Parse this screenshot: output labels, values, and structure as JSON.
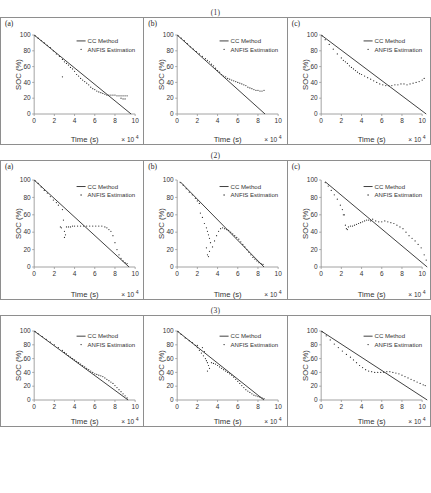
{
  "figure": {
    "rows": [
      {
        "label": "(1)"
      },
      {
        "label": "(2)"
      },
      {
        "label": "(3)"
      }
    ],
    "panel_labels": [
      "(a)",
      "(b)",
      "(c)"
    ],
    "legend": {
      "cc_method": "CC Method",
      "anfis": "ANFIS Estimation"
    },
    "axes": {
      "xlabel": "Time (s)",
      "ylabel": "SOC (%)",
      "x_multiplier": "× 10",
      "x_exponent": "4",
      "yticks": [
        "0",
        "20",
        "40",
        "60",
        "80",
        "100"
      ],
      "xticks": [
        "0",
        "2",
        "4",
        "6",
        "8",
        "10"
      ]
    },
    "colors": {
      "line": "#2b2b2b",
      "marker": "#2b2b2b",
      "axis": "#8c8c8c",
      "border": "#8e8e8e",
      "text": "#333333"
    }
  },
  "chart_data": [
    {
      "id": "r1c1",
      "type": "scatter",
      "title": "(1)(a)",
      "xlabel": "Time (s)",
      "ylabel": "SOC (%)",
      "xlim": [
        0,
        10
      ],
      "ylim": [
        0,
        100
      ],
      "grid": false,
      "legend_position": "top-right",
      "series": [
        {
          "name": "CC Method",
          "style": "line",
          "x": [
            0,
            9.6
          ],
          "y": [
            100,
            0
          ]
        },
        {
          "name": "ANFIS Estimation",
          "style": "markers",
          "x": [
            0.1,
            0.4,
            0.7,
            1.0,
            1.3,
            1.6,
            1.9,
            2.2,
            2.5,
            2.8,
            2.8,
            3.0,
            3.2,
            3.4,
            3.6,
            3.8,
            4.0,
            4.2,
            4.4,
            4.6,
            4.8,
            5.0,
            5.2,
            5.4,
            5.6,
            5.8,
            6.0,
            6.2,
            6.4,
            6.6,
            6.8,
            7.0,
            7.2,
            7.4,
            7.6,
            7.8,
            8.0,
            8.2,
            8.4,
            8.6,
            8.8,
            9.0,
            9.2,
            8.6,
            8.8,
            9.0
          ],
          "y": [
            99,
            96,
            93,
            90,
            87,
            84,
            80,
            76,
            73,
            69,
            47,
            66,
            64,
            62,
            59,
            57,
            54,
            50,
            48,
            45,
            43,
            41,
            39,
            37,
            34,
            32,
            31,
            29,
            28,
            27,
            26,
            25,
            24,
            24,
            24,
            24,
            24,
            23,
            23,
            23,
            23,
            23,
            23,
            20,
            19,
            19
          ]
        }
      ]
    },
    {
      "id": "r1c2",
      "type": "scatter",
      "title": "(1)(b)",
      "xlabel": "Time (s)",
      "ylabel": "SOC (%)",
      "xlim": [
        0,
        10
      ],
      "ylim": [
        0,
        100
      ],
      "grid": false,
      "legend_position": "top-right",
      "series": [
        {
          "name": "CC Method",
          "style": "line",
          "x": [
            0,
            8.7
          ],
          "y": [
            100,
            0
          ]
        },
        {
          "name": "ANFIS Estimation",
          "style": "markers",
          "x": [
            0.1,
            0.4,
            0.7,
            1.0,
            1.3,
            1.6,
            1.9,
            2.2,
            2.5,
            2.8,
            3.0,
            3.2,
            3.4,
            3.6,
            3.8,
            4.0,
            4.2,
            4.4,
            4.6,
            4.8,
            5.0,
            5.2,
            5.4,
            5.6,
            5.8,
            6.0,
            6.2,
            6.4,
            6.6,
            6.8,
            7.0,
            7.2,
            7.4,
            7.6,
            7.8,
            8.0,
            8.2,
            8.4,
            8.6
          ],
          "y": [
            99,
            96,
            93,
            89,
            85,
            82,
            79,
            76,
            73,
            70,
            68,
            66,
            63,
            61,
            58,
            55,
            53,
            50,
            48,
            47,
            45,
            44,
            43,
            42,
            41,
            40,
            39,
            38,
            37,
            36,
            34,
            33,
            32,
            31,
            30,
            30,
            29,
            29,
            30
          ]
        }
      ]
    },
    {
      "id": "r1c3",
      "type": "scatter",
      "title": "(1)(c)",
      "xlabel": "Time (s)",
      "ylabel": "SOC (%)",
      "xlim": [
        0,
        10
      ],
      "ylim": [
        0,
        100
      ],
      "grid": false,
      "legend_position": "top-right",
      "series": [
        {
          "name": "CC Method",
          "style": "line",
          "x": [
            0,
            10.4
          ],
          "y": [
            100,
            0
          ]
        },
        {
          "name": "ANFIS Estimation",
          "style": "markers",
          "x": [
            0.1,
            0.4,
            0.8,
            1.2,
            1.6,
            2.0,
            2.2,
            2.4,
            2.6,
            2.8,
            3.0,
            3.2,
            3.4,
            3.6,
            3.8,
            4.0,
            4.3,
            4.6,
            4.9,
            5.2,
            5.5,
            5.8,
            6.1,
            6.4,
            6.7,
            7.0,
            7.3,
            7.6,
            7.9,
            8.2,
            8.5,
            8.8,
            9.1,
            9.4,
            9.7,
            10.0,
            10.2
          ],
          "y": [
            99,
            94,
            88,
            82,
            76,
            71,
            68,
            66,
            64,
            61,
            59,
            57,
            55,
            53,
            51,
            50,
            48,
            46,
            44,
            42,
            40,
            38,
            37,
            36,
            36,
            36,
            37,
            37,
            38,
            38,
            37,
            38,
            39,
            40,
            41,
            43,
            45
          ]
        }
      ]
    },
    {
      "id": "r2c1",
      "type": "scatter",
      "title": "(2)(a)",
      "xlabel": "Time (s)",
      "ylabel": "SOC (%)",
      "xlim": [
        0,
        10
      ],
      "ylim": [
        0,
        100
      ],
      "grid": false,
      "legend_position": "top-right",
      "series": [
        {
          "name": "CC Method",
          "style": "line",
          "x": [
            0,
            9.4
          ],
          "y": [
            100,
            0
          ]
        },
        {
          "name": "ANFIS Estimation",
          "style": "markers",
          "x": [
            0.1,
            0.4,
            0.7,
            1.0,
            1.3,
            1.6,
            1.9,
            2.2,
            2.4,
            2.8,
            2.9,
            3.0,
            3.0,
            3.1,
            2.6,
            2.7,
            3.2,
            3.4,
            3.6,
            3.8,
            4.0,
            4.3,
            4.6,
            4.9,
            5.2,
            5.5,
            5.8,
            6.1,
            6.4,
            6.7,
            7.0,
            7.2,
            7.4,
            7.6,
            7.8,
            8.0,
            8.2,
            8.4,
            8.6,
            8.8,
            9.0,
            9.2
          ],
          "y": [
            99,
            96,
            92,
            88,
            85,
            81,
            77,
            74,
            71,
            66,
            54,
            41,
            34,
            37,
            46,
            45,
            46,
            46,
            46,
            47,
            47,
            47,
            47,
            47,
            47,
            47,
            47,
            47,
            47,
            47,
            46,
            45,
            43,
            41,
            36,
            28,
            20,
            14,
            10,
            7,
            5,
            4
          ]
        }
      ]
    },
    {
      "id": "r2c2",
      "type": "scatter",
      "title": "(2)(b)",
      "xlabel": "Time (s)",
      "ylabel": "SOC (%)",
      "xlim": [
        0,
        10
      ],
      "ylim": [
        0,
        100
      ],
      "grid": false,
      "legend_position": "top-right",
      "series": [
        {
          "name": "CC Method",
          "style": "line",
          "x": [
            0.3,
            8.6
          ],
          "y": [
            98,
            0
          ]
        },
        {
          "name": "ANFIS Estimation",
          "style": "markers",
          "x": [
            0.3,
            0.6,
            0.9,
            1.2,
            1.5,
            1.8,
            2.0,
            2.2,
            2.3,
            2.5,
            2.7,
            2.9,
            3.0,
            3.1,
            3.2,
            3.3,
            3.5,
            3.7,
            3.9,
            4.1,
            4.3,
            4.5,
            4.7,
            4.9,
            5.1,
            5.3,
            5.5,
            5.7,
            5.9,
            6.1,
            6.3,
            6.5,
            6.7,
            6.9,
            7.1,
            7.3,
            7.5,
            7.7,
            7.9,
            8.1,
            8.3,
            8.5,
            3.0,
            3.1,
            3.2,
            2.9
          ],
          "y": [
            97,
            94,
            90,
            86,
            83,
            79,
            76,
            73,
            62,
            57,
            50,
            45,
            41,
            37,
            33,
            28,
            23,
            30,
            36,
            41,
            44,
            45,
            44,
            43,
            42,
            40,
            38,
            36,
            34,
            32,
            29,
            26,
            23,
            20,
            17,
            14,
            11,
            9,
            7,
            5,
            4,
            3,
            14,
            12,
            18,
            22
          ]
        }
      ]
    },
    {
      "id": "r2c3",
      "type": "scatter",
      "title": "(2)(c)",
      "xlabel": "Time (s)",
      "ylabel": "SOC (%)",
      "xlim": [
        0,
        10
      ],
      "ylim": [
        0,
        100
      ],
      "grid": false,
      "legend_position": "top-right",
      "series": [
        {
          "name": "CC Method",
          "style": "line",
          "x": [
            0.4,
            10.5
          ],
          "y": [
            98,
            0
          ]
        },
        {
          "name": "ANFIS Estimation",
          "style": "markers",
          "x": [
            0.4,
            0.7,
            1.0,
            1.3,
            1.6,
            1.9,
            2.1,
            2.3,
            2.4,
            2.5,
            2.7,
            2.9,
            3.1,
            3.3,
            3.5,
            3.7,
            3.9,
            4.1,
            4.3,
            4.5,
            4.7,
            4.9,
            5.1,
            5.4,
            5.7,
            6.0,
            6.3,
            6.6,
            6.9,
            7.2,
            7.5,
            7.8,
            8.1,
            8.4,
            8.7,
            9.0,
            9.3,
            9.6,
            9.9,
            10.2,
            10.4,
            2.2,
            2.6
          ],
          "y": [
            97,
            93,
            88,
            83,
            78,
            71,
            66,
            60,
            48,
            44,
            46,
            47,
            47,
            48,
            49,
            50,
            51,
            52,
            53,
            54,
            54,
            53,
            55,
            53,
            52,
            52,
            53,
            52,
            51,
            50,
            48,
            46,
            44,
            40,
            36,
            33,
            30,
            26,
            22,
            14,
            8,
            60,
            43
          ]
        }
      ]
    },
    {
      "id": "r3c1",
      "type": "scatter",
      "title": "(3)(a)",
      "xlabel": "Time (s)",
      "ylabel": "SOC (%)",
      "xlim": [
        0,
        10
      ],
      "ylim": [
        0,
        100
      ],
      "grid": false,
      "legend_position": "top-right",
      "series": [
        {
          "name": "CC Method",
          "style": "line",
          "x": [
            0,
            9.3
          ],
          "y": [
            100,
            0
          ]
        },
        {
          "name": "ANFIS Estimation",
          "style": "markers",
          "x": [
            0.1,
            0.4,
            0.8,
            1.2,
            1.6,
            2.0,
            2.4,
            2.8,
            3.0,
            3.2,
            3.4,
            3.6,
            3.8,
            4.0,
            4.2,
            4.4,
            4.6,
            4.8,
            5.0,
            5.2,
            5.4,
            5.6,
            5.8,
            6.0,
            6.2,
            6.4,
            6.6,
            6.8,
            7.0,
            7.2,
            7.4,
            7.6,
            7.8,
            8.0,
            8.2,
            8.4,
            8.6,
            8.8,
            9.0,
            9.2
          ],
          "y": [
            99,
            96,
            92,
            88,
            84,
            80,
            76,
            72,
            69,
            67,
            64,
            62,
            60,
            58,
            56,
            54,
            52,
            50,
            48,
            46,
            44,
            42,
            40,
            38,
            37,
            36,
            35,
            34,
            32,
            30,
            28,
            26,
            24,
            21,
            18,
            15,
            12,
            9,
            6,
            3
          ]
        }
      ]
    },
    {
      "id": "r3c2",
      "type": "scatter",
      "title": "(3)(b)",
      "xlabel": "Time (s)",
      "ylabel": "SOC (%)",
      "xlim": [
        0,
        10
      ],
      "ylim": [
        0,
        100
      ],
      "grid": false,
      "legend_position": "top-right",
      "series": [
        {
          "name": "CC Method",
          "style": "line",
          "x": [
            0,
            8.6
          ],
          "y": [
            100,
            0
          ]
        },
        {
          "name": "ANFIS Estimation",
          "style": "markers",
          "x": [
            0.1,
            0.4,
            0.8,
            1.2,
            1.5,
            1.8,
            2.0,
            2.2,
            2.4,
            2.6,
            2.8,
            2.9,
            3.0,
            3.1,
            3.2,
            3.4,
            3.6,
            3.8,
            4.0,
            4.2,
            4.4,
            4.6,
            4.8,
            5.0,
            5.2,
            5.4,
            5.6,
            5.8,
            6.0,
            6.2,
            6.4,
            6.6,
            6.8,
            7.0,
            7.2,
            7.4,
            7.6,
            7.8,
            8.0,
            8.2,
            8.4,
            8.6,
            2.5,
            2.7,
            3.0,
            2.0
          ],
          "y": [
            99,
            95,
            90,
            86,
            83,
            79,
            76,
            72,
            68,
            64,
            60,
            57,
            54,
            50,
            46,
            54,
            53,
            52,
            50,
            48,
            46,
            44,
            42,
            40,
            38,
            36,
            33,
            30,
            27,
            24,
            21,
            18,
            15,
            13,
            11,
            9,
            7,
            6,
            5,
            4,
            3,
            2,
            76,
            70,
            42,
            79
          ]
        }
      ]
    },
    {
      "id": "r3c3",
      "type": "scatter",
      "title": "(3)(c)",
      "xlabel": "Time (s)",
      "ylabel": "SOC (%)",
      "xlim": [
        0,
        10
      ],
      "ylim": [
        0,
        100
      ],
      "grid": false,
      "legend_position": "top-right",
      "series": [
        {
          "name": "CC Method",
          "style": "line",
          "x": [
            0,
            10.5
          ],
          "y": [
            100,
            0
          ]
        },
        {
          "name": "ANFIS Estimation",
          "style": "markers",
          "x": [
            0.1,
            0.5,
            0.9,
            1.3,
            1.7,
            2.1,
            2.5,
            2.9,
            3.2,
            3.5,
            3.8,
            4.1,
            4.4,
            4.7,
            5.0,
            5.3,
            5.6,
            5.9,
            6.2,
            6.5,
            6.8,
            7.1,
            7.4,
            7.7,
            8.0,
            8.3,
            8.6,
            8.9,
            9.2,
            9.5,
            9.8,
            10.1,
            10.3
          ],
          "y": [
            99,
            93,
            87,
            81,
            76,
            71,
            66,
            62,
            58,
            54,
            50,
            47,
            44,
            42,
            41,
            40,
            40,
            40,
            40,
            41,
            41,
            40,
            39,
            38,
            36,
            34,
            32,
            30,
            28,
            26,
            24,
            22,
            21
          ]
        }
      ]
    }
  ]
}
